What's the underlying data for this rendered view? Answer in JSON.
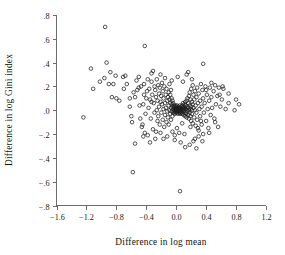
{
  "chart_data": {
    "type": "scatter",
    "title": "",
    "xlabel": "Difference in log mean",
    "ylabel": "Difference in log Gini index",
    "xlim": [
      -1.6,
      1.2
    ],
    "ylim": [
      -0.8,
      0.8
    ],
    "xticks": [
      -1.6,
      -1.2,
      -0.8,
      -0.4,
      0.0,
      0.4,
      0.8,
      1.2
    ],
    "xticklabels": [
      "−1.6",
      "−1.2",
      "−0.8",
      "−0.4",
      "0.0",
      "0.4",
      "0.8",
      "1.2"
    ],
    "yticks": [
      -0.8,
      -0.6,
      -0.4,
      -0.2,
      0.0,
      0.2,
      0.4,
      0.6,
      0.8
    ],
    "yticklabels": [
      "−.8",
      "−.6",
      "−.4",
      "−.2",
      ".0",
      ".2",
      ".4",
      ".6",
      ".8"
    ],
    "grid": false,
    "legend": false,
    "marker": "open-circle",
    "marker_color": "#1c1c1c",
    "marker_radius_px": 1.8,
    "series": [
      {
        "name": "country-spell observations",
        "points": [
          [
            -1.24,
            -0.06
          ],
          [
            -0.95,
            0.7
          ],
          [
            -0.42,
            0.54
          ],
          [
            -1.14,
            0.35
          ],
          [
            -1.11,
            0.18
          ],
          [
            -1.02,
            0.24
          ],
          [
            -0.96,
            0.27
          ],
          [
            -0.93,
            0.4
          ],
          [
            -0.88,
            0.32
          ],
          [
            -0.9,
            0.22
          ],
          [
            -0.86,
            0.11
          ],
          [
            -0.8,
            0.1
          ],
          [
            -0.81,
            0.29
          ],
          [
            -0.76,
            0.08
          ],
          [
            -0.71,
            0.28
          ],
          [
            -0.68,
            0.29
          ],
          [
            -0.66,
            0.22
          ],
          [
            -0.62,
            0.03
          ],
          [
            -0.6,
            -0.05
          ],
          [
            -0.59,
            -0.1
          ],
          [
            -0.57,
            0.15
          ],
          [
            -0.58,
            -0.52
          ],
          [
            -0.55,
            -0.28
          ],
          [
            -0.55,
            0.11
          ],
          [
            -0.52,
            0.17
          ],
          [
            -0.5,
            0.19
          ],
          [
            -0.49,
            0.04
          ],
          [
            -0.47,
            0.2
          ],
          [
            -0.46,
            -0.14
          ],
          [
            -0.45,
            -0.12
          ],
          [
            -0.44,
            0.05
          ],
          [
            -0.43,
            0.13
          ],
          [
            -0.42,
            -0.19
          ],
          [
            -0.41,
            -0.03
          ],
          [
            -0.4,
            0.1
          ],
          [
            -0.39,
            0.16
          ],
          [
            -0.38,
            -0.21
          ],
          [
            -0.37,
            0.02
          ],
          [
            -0.36,
            0.18
          ],
          [
            -0.35,
            0.09
          ],
          [
            -0.34,
            -0.07
          ],
          [
            -0.33,
            0.24
          ],
          [
            -0.33,
            0.31
          ],
          [
            -0.32,
            0.13
          ],
          [
            -0.31,
            -0.16
          ],
          [
            -0.3,
            0.06
          ],
          [
            -0.29,
            0.2
          ],
          [
            -0.29,
            -0.02
          ],
          [
            -0.28,
            0.17
          ],
          [
            -0.28,
            -0.24
          ],
          [
            -0.27,
            0.11
          ],
          [
            -0.26,
            0.0
          ],
          [
            -0.26,
            0.26
          ],
          [
            -0.25,
            0.08
          ],
          [
            -0.25,
            -0.09
          ],
          [
            -0.24,
            0.21
          ],
          [
            -0.24,
            -0.05
          ],
          [
            -0.23,
            0.14
          ],
          [
            -0.23,
            0.03
          ],
          [
            -0.22,
            -0.12
          ],
          [
            -0.22,
            0.19
          ],
          [
            -0.21,
            0.07
          ],
          [
            -0.21,
            -0.19
          ],
          [
            -0.2,
            0.12
          ],
          [
            -0.2,
            -0.02
          ],
          [
            -0.19,
            0.23
          ],
          [
            -0.19,
            0.05
          ],
          [
            -0.18,
            -0.08
          ],
          [
            -0.18,
            0.16
          ],
          [
            -0.17,
            0.01
          ],
          [
            -0.17,
            0.1
          ],
          [
            -0.16,
            -0.14
          ],
          [
            -0.16,
            0.2
          ],
          [
            -0.15,
            0.06
          ],
          [
            -0.15,
            -0.04
          ],
          [
            -0.14,
            0.13
          ],
          [
            -0.14,
            0.02
          ],
          [
            -0.13,
            -0.1
          ],
          [
            -0.13,
            0.18
          ],
          [
            -0.12,
            0.08
          ],
          [
            -0.12,
            -0.01
          ],
          [
            -0.11,
            0.11
          ],
          [
            -0.11,
            -0.06
          ],
          [
            -0.1,
            0.15
          ],
          [
            -0.1,
            0.04
          ],
          [
            -0.1,
            -0.12
          ],
          [
            -0.09,
            0.09
          ],
          [
            -0.09,
            0.0
          ],
          [
            -0.09,
            0.22
          ],
          [
            -0.08,
            0.06
          ],
          [
            -0.08,
            -0.03
          ],
          [
            -0.08,
            0.13
          ],
          [
            -0.07,
            0.02
          ],
          [
            -0.07,
            -0.08
          ],
          [
            -0.07,
            0.17
          ],
          [
            -0.06,
            0.05
          ],
          [
            -0.06,
            -0.01
          ],
          [
            -0.06,
            0.1
          ],
          [
            -0.05,
            0.03
          ],
          [
            -0.05,
            -0.05
          ],
          [
            -0.05,
            0.08
          ],
          [
            -0.04,
            0.01
          ],
          [
            -0.04,
            -0.02
          ],
          [
            -0.04,
            0.06
          ],
          [
            -0.03,
            0.04
          ],
          [
            -0.03,
            -0.01
          ],
          [
            -0.03,
            0.02
          ],
          [
            -0.02,
            0.0
          ],
          [
            -0.02,
            0.03
          ],
          [
            -0.02,
            -0.03
          ],
          [
            -0.01,
            0.01
          ],
          [
            -0.01,
            -0.02
          ],
          [
            -0.01,
            0.04
          ],
          [
            0.0,
            0.0
          ],
          [
            0.0,
            0.02
          ],
          [
            0.0,
            -0.01
          ],
          [
            0.0,
            0.03
          ],
          [
            0.01,
            0.01
          ],
          [
            0.01,
            -0.02
          ],
          [
            0.01,
            0.04
          ],
          [
            0.02,
            0.0
          ],
          [
            0.02,
            0.02
          ],
          [
            0.02,
            -0.03
          ],
          [
            0.03,
            0.01
          ],
          [
            0.03,
            -0.01
          ],
          [
            0.03,
            0.03
          ],
          [
            0.04,
            0.0
          ],
          [
            0.04,
            0.02
          ],
          [
            0.04,
            -0.02
          ],
          [
            0.05,
            0.01
          ],
          [
            0.05,
            -0.03
          ],
          [
            0.05,
            0.04
          ],
          [
            0.06,
            0.0
          ],
          [
            0.06,
            0.02
          ],
          [
            0.06,
            -0.01
          ],
          [
            0.07,
            0.03
          ],
          [
            0.07,
            -0.02
          ],
          [
            0.07,
            0.01
          ],
          [
            0.08,
            0.0
          ],
          [
            0.08,
            0.04
          ],
          [
            0.08,
            -0.03
          ],
          [
            0.09,
            0.02
          ],
          [
            0.09,
            -0.01
          ],
          [
            0.09,
            0.06
          ],
          [
            0.1,
            0.01
          ],
          [
            0.1,
            -0.04
          ],
          [
            0.1,
            0.03
          ],
          [
            0.11,
            0.0
          ],
          [
            0.11,
            0.05
          ],
          [
            0.11,
            -0.02
          ],
          [
            0.12,
            0.02
          ],
          [
            0.12,
            -0.05
          ],
          [
            0.12,
            0.07
          ],
          [
            0.13,
            0.01
          ],
          [
            0.13,
            -0.03
          ],
          [
            0.13,
            0.04
          ],
          [
            0.14,
            0.0
          ],
          [
            0.14,
            0.08
          ],
          [
            0.14,
            -0.06
          ],
          [
            0.15,
            0.03
          ],
          [
            0.15,
            -0.01
          ],
          [
            0.15,
            0.1
          ],
          [
            0.16,
            0.02
          ],
          [
            0.16,
            -0.04
          ],
          [
            0.16,
            0.06
          ],
          [
            0.17,
            0.0
          ],
          [
            0.17,
            0.12
          ],
          [
            0.17,
            -0.07
          ],
          [
            0.18,
            0.04
          ],
          [
            0.18,
            -0.02
          ],
          [
            0.18,
            0.15
          ],
          [
            0.19,
            0.01
          ],
          [
            0.19,
            -0.05
          ],
          [
            0.19,
            0.09
          ],
          [
            0.2,
            0.03
          ],
          [
            0.2,
            0.18
          ],
          [
            0.2,
            -0.09
          ],
          [
            0.21,
            0.0
          ],
          [
            0.21,
            0.07
          ],
          [
            0.21,
            -0.03
          ],
          [
            0.22,
            0.21
          ],
          [
            0.22,
            0.05
          ],
          [
            0.22,
            -0.11
          ],
          [
            0.23,
            0.02
          ],
          [
            0.23,
            0.13
          ],
          [
            0.24,
            -0.06
          ],
          [
            0.24,
            0.09
          ],
          [
            0.25,
            0.0
          ],
          [
            0.25,
            0.16
          ],
          [
            0.26,
            -0.13
          ],
          [
            0.26,
            0.04
          ],
          [
            0.27,
            0.11
          ],
          [
            0.27,
            -0.02
          ],
          [
            0.28,
            0.19
          ],
          [
            0.28,
            -0.08
          ],
          [
            0.29,
            0.06
          ],
          [
            0.3,
            0.14
          ],
          [
            0.3,
            -0.17
          ],
          [
            0.31,
            0.01
          ],
          [
            0.32,
            0.08
          ],
          [
            0.32,
            -0.05
          ],
          [
            0.33,
            0.22
          ],
          [
            0.34,
            -0.12
          ],
          [
            0.34,
            0.03
          ],
          [
            0.35,
            0.17
          ],
          [
            0.36,
            -0.2
          ],
          [
            0.36,
            0.1
          ],
          [
            0.37,
            -0.02
          ],
          [
            0.38,
            0.06
          ],
          [
            0.39,
            0.2
          ],
          [
            0.4,
            -0.09
          ],
          [
            0.41,
            0.13
          ],
          [
            0.42,
            0.01
          ],
          [
            0.43,
            -0.15
          ],
          [
            0.44,
            0.08
          ],
          [
            0.45,
            0.19
          ],
          [
            0.46,
            -0.04
          ],
          [
            0.47,
            0.11
          ],
          [
            0.48,
            0.02
          ],
          [
            0.5,
            0.16
          ],
          [
            0.51,
            -0.07
          ],
          [
            0.52,
            0.21
          ],
          [
            0.53,
            0.05
          ],
          [
            0.55,
            0.12
          ],
          [
            0.56,
            -0.14
          ],
          [
            0.57,
            0.19
          ],
          [
            0.59,
            0.03
          ],
          [
            0.61,
            0.09
          ],
          [
            0.63,
            0.18
          ],
          [
            0.66,
            0.01
          ],
          [
            0.7,
            0.06
          ],
          [
            0.78,
            0.0
          ],
          [
            0.8,
            0.09
          ],
          [
            0.84,
            0.05
          ],
          [
            0.05,
            -0.68
          ],
          [
            0.12,
            -0.31
          ],
          [
            0.18,
            -0.29
          ],
          [
            0.23,
            -0.26
          ],
          [
            0.27,
            -0.32
          ],
          [
            0.3,
            -0.22
          ],
          [
            0.06,
            -0.27
          ],
          [
            -0.02,
            -0.25
          ],
          [
            -0.12,
            -0.22
          ],
          [
            -0.35,
            -0.27
          ],
          [
            -0.44,
            -0.22
          ],
          [
            -0.5,
            0.28
          ],
          [
            -0.62,
            0.1
          ],
          [
            -0.31,
            0.33
          ],
          [
            -0.21,
            0.3
          ],
          [
            -0.15,
            0.27
          ],
          [
            -0.06,
            0.25
          ],
          [
            0.02,
            0.28
          ],
          [
            0.09,
            0.24
          ],
          [
            0.14,
            0.3
          ],
          [
            0.21,
            0.26
          ],
          [
            0.36,
            0.39
          ],
          [
            0.16,
            0.32
          ],
          [
            0.11,
            -0.2
          ],
          [
            -0.05,
            -0.18
          ],
          [
            -0.17,
            -0.24
          ],
          [
            -0.27,
            -0.18
          ],
          [
            0.01,
            -0.15
          ],
          [
            0.25,
            -0.24
          ],
          [
            0.44,
            -0.19
          ],
          [
            0.47,
            0.23
          ],
          [
            0.52,
            -0.1
          ],
          [
            0.33,
            -0.09
          ],
          [
            0.08,
            -0.11
          ],
          [
            -0.33,
            0.07
          ],
          [
            0.4,
            0.17
          ],
          [
            0.58,
            0.13
          ],
          [
            0.62,
            0.2
          ],
          [
            0.7,
            0.14
          ],
          [
            -0.7,
            0.18
          ],
          [
            -0.84,
            0.22
          ],
          [
            -0.48,
            -0.07
          ],
          [
            -0.53,
            0.25
          ],
          [
            0.19,
            -0.14
          ],
          [
            0.04,
            -0.19
          ],
          [
            -0.02,
            -0.21
          ],
          [
            0.29,
            -0.15
          ],
          [
            0.35,
            -0.26
          ],
          [
            -0.38,
            0.26
          ],
          [
            -0.43,
            0.22
          ]
        ]
      }
    ]
  }
}
